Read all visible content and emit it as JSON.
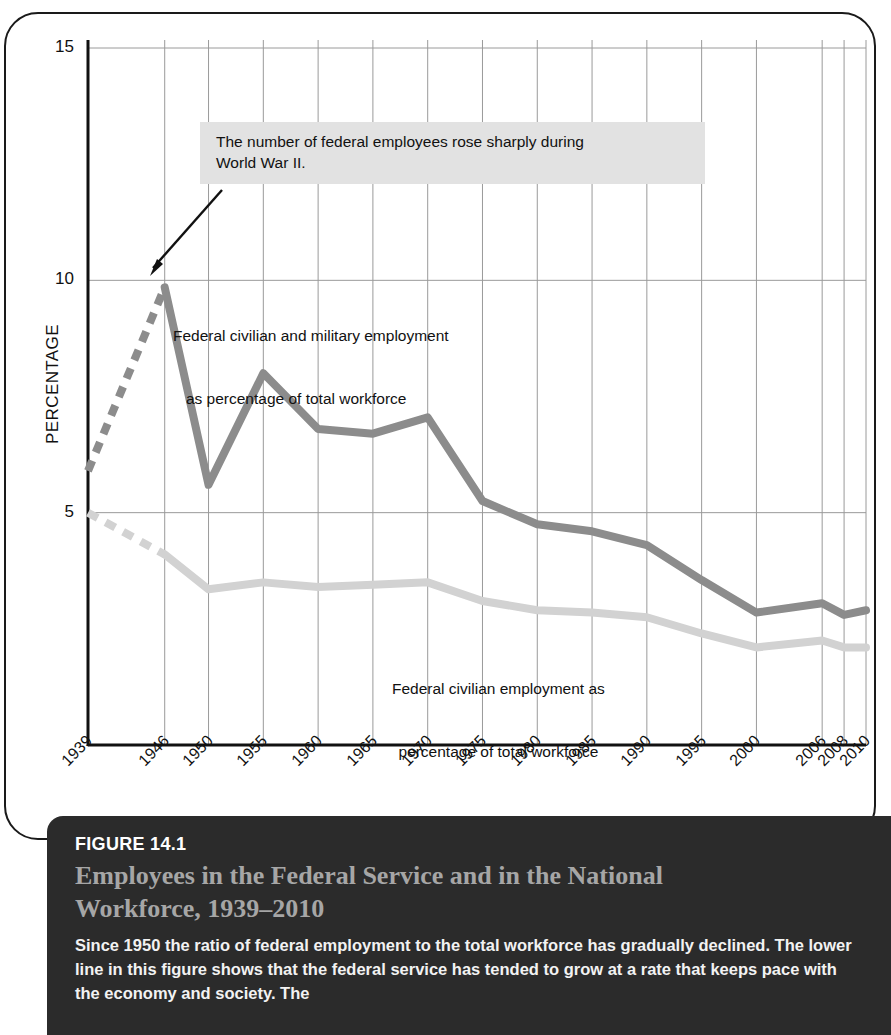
{
  "figure": {
    "number_label": "FIGURE 14.1",
    "title": "Employees in the Federal Service and in the National Workforce, 1939–2010",
    "body": "Since 1950 the ratio of federal employment to the total workforce has gradually declined. The lower line in this figure shows that the federal service has tended to grow at a rate that keeps pace with the economy and society. The"
  },
  "colors": {
    "upper_series": "#8c8c8c",
    "lower_series": "#d2d2d2",
    "grid": "#9a9a9a",
    "axis": "#111111",
    "annotation_bg": "#e2e2e2",
    "caption_bg": "#2b2b2b",
    "caption_title": "#a6a6a6"
  },
  "annotations": {
    "callout_line1": "The number of federal employees rose sharply during",
    "callout_line2": "World War II.",
    "upper_series_label_line1": "Federal civilian and military employment",
    "upper_series_label_line2": "   as percentage of total workforce",
    "lower_series_label_line1": "Federal civilian employment as",
    "lower_series_label_line2": "percentage of total workforce"
  },
  "chart_data": {
    "type": "line",
    "title": "Employees in the Federal Service and in the National Workforce, 1939–2010",
    "xlabel": "",
    "ylabel": "PERCENTAGE",
    "categories": [
      "1939",
      "1946",
      "1950",
      "1955",
      "1960",
      "1965",
      "1970",
      "1975",
      "1980",
      "1985",
      "1990",
      "1995",
      "2000",
      "2006",
      "2008",
      "2010"
    ],
    "ylim": [
      0,
      15
    ],
    "yticks": [
      5,
      10,
      15
    ],
    "ytick_labels": [
      "5",
      "10",
      "15"
    ],
    "grid": true,
    "legend": "inline-labels",
    "series": [
      {
        "name": "Federal civilian and military employment as percentage of total workforce",
        "color": "#8c8c8c",
        "dashed_from_index": 0,
        "dashed_to_index": 1,
        "values": [
          5.9,
          9.85,
          5.6,
          8.0,
          6.8,
          6.7,
          7.05,
          5.25,
          4.75,
          4.6,
          4.3,
          3.55,
          2.85,
          3.05,
          2.8,
          2.9
        ]
      },
      {
        "name": "Federal civilian employment as percentage of total workforce",
        "color": "#d2d2d2",
        "dashed_from_index": 0,
        "dashed_to_index": 1,
        "values": [
          5.0,
          4.1,
          3.35,
          3.5,
          3.4,
          3.45,
          3.5,
          3.1,
          2.9,
          2.85,
          2.75,
          2.4,
          2.1,
          2.25,
          2.1,
          2.1
        ]
      }
    ]
  }
}
